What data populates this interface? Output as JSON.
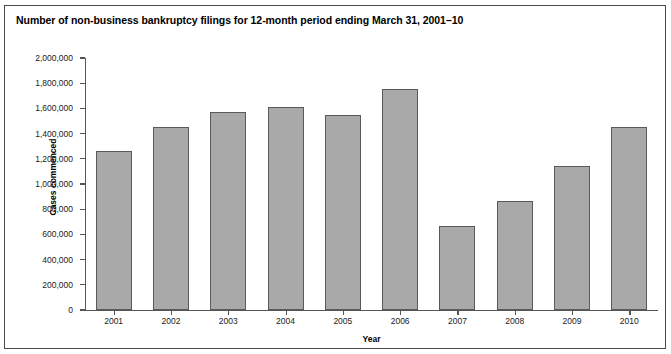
{
  "chart_data": {
    "type": "bar",
    "title": "Number of non-business bankruptcy filings for 12-month period ending March 31, 2001–10",
    "xlabel": "Year",
    "ylabel": "Cases commenced",
    "categories": [
      "2001",
      "2002",
      "2003",
      "2004",
      "2005",
      "2006",
      "2007",
      "2008",
      "2009",
      "2010"
    ],
    "values": [
      1265000,
      1455000,
      1570000,
      1615000,
      1550000,
      1755000,
      665000,
      865000,
      1145000,
      1450000
    ],
    "ylim": [
      0,
      2000000
    ],
    "yticks": [
      0,
      200000,
      400000,
      600000,
      800000,
      1000000,
      1200000,
      1400000,
      1600000,
      1800000,
      2000000
    ],
    "ytick_labels": [
      "0",
      "200,000",
      "400,000",
      "600,000",
      "800,000",
      "1,000,000",
      "1,200,000",
      "1,400,000",
      "1,600,000",
      "1,800,000",
      "2,000,000"
    ],
    "grid": false,
    "legend": null,
    "bar_color": "#a9a9a9",
    "bar_edge_color": "#5a5a5a",
    "axis_color": "#555555",
    "frame_color": "#4a4a4a",
    "background": "#ffffff"
  }
}
